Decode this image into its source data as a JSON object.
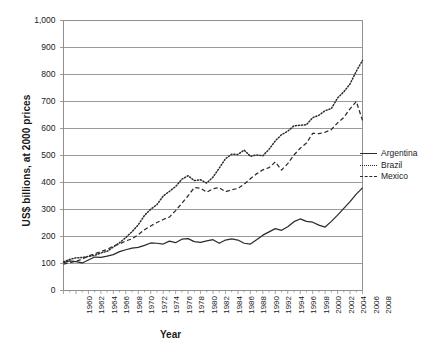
{
  "chart_data": {
    "type": "line",
    "title": "",
    "xlabel": "Year",
    "ylabel": "US$ billions, at 2000 prices",
    "xlim": [
      1960,
      2008
    ],
    "ylim": [
      0,
      1000
    ],
    "grid": true,
    "legend_position": "right",
    "y_ticks": [
      "0",
      "100",
      "200",
      "300",
      "400",
      "500",
      "600",
      "700",
      "800",
      "900",
      "1,000"
    ],
    "y_tick_values": [
      0,
      100,
      200,
      300,
      400,
      500,
      600,
      700,
      800,
      900,
      1000
    ],
    "x_ticks": [
      "1960",
      "1962",
      "1964",
      "1966",
      "1968",
      "1970",
      "1972",
      "1974",
      "1976",
      "1978",
      "1980",
      "1982",
      "1984",
      "1986",
      "1988",
      "1990",
      "1992",
      "1994",
      "1996",
      "1998",
      "2000",
      "2002",
      "2004",
      "2006",
      "2008"
    ],
    "x": [
      1960,
      1961,
      1962,
      1963,
      1964,
      1965,
      1966,
      1967,
      1968,
      1969,
      1970,
      1971,
      1972,
      1973,
      1974,
      1975,
      1976,
      1977,
      1978,
      1979,
      1980,
      1981,
      1982,
      1983,
      1984,
      1985,
      1986,
      1987,
      1988,
      1989,
      1990,
      1991,
      1992,
      1993,
      1994,
      1995,
      1996,
      1997,
      1998,
      1999,
      2000,
      2001,
      2002,
      2003,
      2004,
      2005,
      2006,
      2007,
      2008
    ],
    "series": [
      {
        "name": "Argentina",
        "style": "solid",
        "color": "#2b2b2b",
        "values": [
          103,
          110,
          107,
          102,
          113,
          124,
          123,
          127,
          133,
          144,
          151,
          157,
          160,
          167,
          176,
          175,
          172,
          183,
          177,
          190,
          192,
          181,
          178,
          184,
          188,
          175,
          187,
          191,
          187,
          175,
          172,
          188,
          205,
          217,
          229,
          223,
          236,
          255,
          265,
          256,
          253,
          242,
          235,
          256,
          279,
          304,
          329,
          357,
          380
        ]
      },
      {
        "name": "Brazil",
        "style": "dotted",
        "color": "#2b2b2b",
        "values": [
          106,
          115,
          121,
          122,
          126,
          130,
          139,
          145,
          161,
          177,
          196,
          218,
          243,
          278,
          301,
          318,
          350,
          367,
          385,
          412,
          425,
          407,
          410,
          398,
          420,
          453,
          488,
          505,
          504,
          520,
          497,
          502,
          499,
          523,
          554,
          577,
          590,
          610,
          612,
          614,
          640,
          649,
          666,
          674,
          713,
          736,
          765,
          812,
          852
        ]
      },
      {
        "name": "Mexico",
        "style": "dashed",
        "color": "#2b2b2b",
        "values": [
          98,
          103,
          108,
          116,
          128,
          136,
          144,
          152,
          165,
          172,
          184,
          191,
          207,
          225,
          239,
          252,
          263,
          272,
          296,
          323,
          351,
          381,
          379,
          364,
          377,
          381,
          366,
          373,
          378,
          394,
          414,
          432,
          447,
          455,
          476,
          446,
          470,
          502,
          527,
          546,
          582,
          581,
          586,
          596,
          621,
          641,
          673,
          700,
          630
        ]
      }
    ]
  },
  "legend": {
    "items": [
      {
        "label": "Argentina",
        "style": "solid"
      },
      {
        "label": "Brazil",
        "style": "dotted"
      },
      {
        "label": "Mexico",
        "style": "dashed"
      }
    ]
  }
}
